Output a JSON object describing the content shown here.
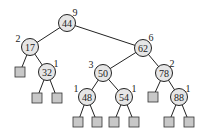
{
  "diagram": {
    "type": "binary-search-tree",
    "nodes": [
      {
        "id": "n44",
        "key": "44",
        "height": "9",
        "x": 67,
        "y": 23,
        "lx": 75,
        "ly": 12
      },
      {
        "id": "n17",
        "key": "17",
        "height": "2",
        "x": 30,
        "y": 47,
        "lx": 18,
        "ly": 38
      },
      {
        "id": "n62",
        "key": "62",
        "height": "6",
        "x": 143,
        "y": 48,
        "lx": 151,
        "ly": 37
      },
      {
        "id": "n32",
        "key": "32",
        "height": "1",
        "x": 47,
        "y": 72,
        "lx": 56,
        "ly": 63
      },
      {
        "id": "n50",
        "key": "50",
        "height": "3",
        "x": 103,
        "y": 73,
        "lx": 91,
        "ly": 64
      },
      {
        "id": "n78",
        "key": "78",
        "height": "2",
        "x": 164,
        "y": 73,
        "lx": 172,
        "ly": 63
      },
      {
        "id": "n48",
        "key": "48",
        "height": "1",
        "x": 87,
        "y": 97,
        "lx": 76,
        "ly": 88
      },
      {
        "id": "n54",
        "key": "54",
        "height": "1",
        "x": 124,
        "y": 97,
        "lx": 134,
        "ly": 88
      },
      {
        "id": "n88",
        "key": "88",
        "height": "1",
        "x": 179,
        "y": 97,
        "lx": 188,
        "ly": 88
      }
    ],
    "leaves": [
      {
        "parent": "n17",
        "x": 20,
        "y": 72
      },
      {
        "parent": "n32",
        "x": 37,
        "y": 98
      },
      {
        "parent": "n32",
        "x": 57,
        "y": 98
      },
      {
        "parent": "n48",
        "x": 78,
        "y": 122
      },
      {
        "parent": "n48",
        "x": 97,
        "y": 122
      },
      {
        "parent": "n54",
        "x": 114,
        "y": 122
      },
      {
        "parent": "n54",
        "x": 134,
        "y": 122
      },
      {
        "parent": "n78",
        "x": 153,
        "y": 97
      },
      {
        "parent": "n88",
        "x": 169,
        "y": 122
      },
      {
        "parent": "n88",
        "x": 189,
        "y": 122
      }
    ],
    "edges": [
      [
        "n44",
        "n17"
      ],
      [
        "n44",
        "n62"
      ],
      [
        "n17",
        "n32"
      ],
      [
        "n62",
        "n50"
      ],
      [
        "n62",
        "n78"
      ],
      [
        "n50",
        "n48"
      ],
      [
        "n50",
        "n54"
      ],
      [
        "n78",
        "n88"
      ]
    ]
  }
}
